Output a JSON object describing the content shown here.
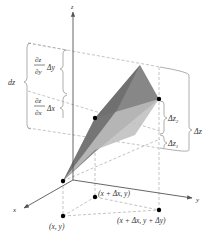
{
  "figure": {
    "axes": {
      "z_label": "z",
      "x_label": "x",
      "y_label": "y"
    },
    "left_brackets": {
      "dz_label": "dz",
      "partial_y": {
        "numerator": "∂z",
        "denominator": "∂y",
        "factor": "Δy"
      },
      "partial_x": {
        "numerator": "∂z",
        "denominator": "∂x",
        "factor": "Δx"
      }
    },
    "right_brackets": {
      "dz2_label": "Δz",
      "dz2_sub": "2",
      "dz1_label": "Δz",
      "dz1_sub": "1",
      "dz_total_label": "Δz"
    },
    "points": {
      "p_xy": "(x, y)",
      "p_xdx_y": "(x + Δx, y)",
      "p_xdx_ydy": "(x + Δx, y + Δy)"
    },
    "colors": {
      "tangent_plane": "#7a7a7a",
      "surface": "#b8b8b8",
      "axis": "#555555",
      "dashed": "#aaaaaa",
      "bracket": "#999999",
      "point": "#000000"
    }
  }
}
